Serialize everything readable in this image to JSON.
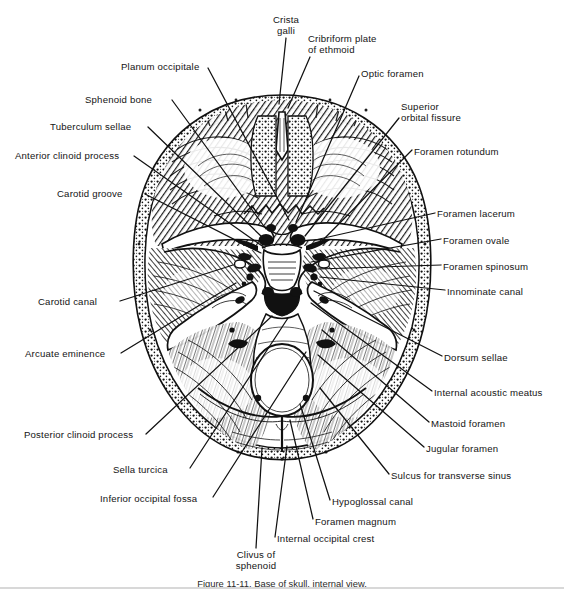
{
  "figure": {
    "caption": "Figure 11-11. Base of skull, internal view.",
    "background_color": "#ffffff",
    "ink_color": "#111111",
    "leader_color": "#111111"
  },
  "labels": [
    {
      "id": "crista-galli",
      "text": "Crista\ngalli",
      "side": "center",
      "x": 286,
      "y": 14,
      "anchor_x": 286,
      "anchor_y": 38,
      "tip_x": 279,
      "tip_y": 104
    },
    {
      "id": "cribriform-plate",
      "text": "Cribriform plate\nof ethmoid",
      "side": "right",
      "x": 308,
      "y": 33,
      "anchor_x": 310,
      "anchor_y": 57,
      "tip_x": 288,
      "tip_y": 108
    },
    {
      "id": "planum-occipitale",
      "text": "Planum occipitale",
      "side": "left",
      "x": 121,
      "y": 61,
      "anchor_x": 208,
      "anchor_y": 68,
      "tip_x": 289,
      "tip_y": 220
    },
    {
      "id": "optic-foramen",
      "text": "Optic foramen",
      "side": "right",
      "x": 361,
      "y": 68,
      "anchor_x": 359,
      "anchor_y": 76,
      "tip_x": 296,
      "tip_y": 222
    },
    {
      "id": "sphenoid-bone",
      "text": "Sphenoid bone",
      "side": "left",
      "x": 85,
      "y": 94,
      "anchor_x": 172,
      "anchor_y": 100,
      "tip_x": 266,
      "tip_y": 229
    },
    {
      "id": "superior-orbital-fissure",
      "text": "Superior\norbital fissure",
      "side": "right",
      "x": 401,
      "y": 101,
      "anchor_x": 399,
      "anchor_y": 118,
      "tip_x": 305,
      "tip_y": 236
    },
    {
      "id": "tuberculum-sellae",
      "text": "Tuberculum sellae",
      "side": "left",
      "x": 50,
      "y": 121,
      "anchor_x": 148,
      "anchor_y": 127,
      "tip_x": 262,
      "tip_y": 237
    },
    {
      "id": "foramen-rotundum",
      "text": "Foramen rotundum",
      "side": "right",
      "x": 414,
      "y": 146,
      "anchor_x": 412,
      "anchor_y": 150,
      "tip_x": 318,
      "tip_y": 245
    },
    {
      "id": "anterior-clinoid-process",
      "text": "Anterior clinoid process",
      "side": "left",
      "x": 15,
      "y": 150,
      "anchor_x": 134,
      "anchor_y": 156,
      "tip_x": 265,
      "tip_y": 248
    },
    {
      "id": "carotid-groove",
      "text": "Carotid groove",
      "side": "left",
      "x": 57,
      "y": 188,
      "anchor_x": 145,
      "anchor_y": 194,
      "tip_x": 261,
      "tip_y": 253
    },
    {
      "id": "foramen-lacerum",
      "text": "Foramen lacerum",
      "side": "right",
      "x": 437,
      "y": 208,
      "anchor_x": 435,
      "anchor_y": 213,
      "tip_x": 315,
      "tip_y": 240
    },
    {
      "id": "foramen-ovale",
      "text": "Foramen ovale",
      "side": "right",
      "x": 443,
      "y": 235,
      "anchor_x": 441,
      "anchor_y": 239,
      "tip_x": 311,
      "tip_y": 262
    },
    {
      "id": "foramen-spinosum",
      "text": "Foramen spinosum",
      "side": "right",
      "x": 443,
      "y": 261,
      "anchor_x": 441,
      "anchor_y": 265,
      "tip_x": 318,
      "tip_y": 269
    },
    {
      "id": "innominate-canal",
      "text": "Innominate canal",
      "side": "right",
      "x": 447,
      "y": 286,
      "anchor_x": 445,
      "anchor_y": 290,
      "tip_x": 320,
      "tip_y": 277
    },
    {
      "id": "carotid-canal",
      "text": "Carotid canal",
      "side": "left",
      "x": 38,
      "y": 296,
      "anchor_x": 120,
      "anchor_y": 301,
      "tip_x": 233,
      "tip_y": 265
    },
    {
      "id": "arcuate-eminence",
      "text": "Arcuate eminence",
      "side": "left",
      "x": 25,
      "y": 348,
      "anchor_x": 121,
      "anchor_y": 353,
      "tip_x": 236,
      "tip_y": 283
    },
    {
      "id": "dorsum-sellae",
      "text": "Dorsum sellae",
      "side": "right",
      "x": 444,
      "y": 352,
      "anchor_x": 442,
      "anchor_y": 356,
      "tip_x": 314,
      "tip_y": 291
    },
    {
      "id": "internal-acoustic-meatus",
      "text": "Internal acoustic meatus",
      "side": "right",
      "x": 434,
      "y": 387,
      "anchor_x": 432,
      "anchor_y": 391,
      "tip_x": 311,
      "tip_y": 303
    },
    {
      "id": "mastoid-foramen",
      "text": "Mastoid foramen",
      "side": "right",
      "x": 431,
      "y": 418,
      "anchor_x": 429,
      "anchor_y": 422,
      "tip_x": 322,
      "tip_y": 330
    },
    {
      "id": "posterior-clinoid-process",
      "text": "Posterior clinoid process",
      "side": "left",
      "x": 24,
      "y": 429,
      "anchor_x": 146,
      "anchor_y": 434,
      "tip_x": 272,
      "tip_y": 316
    },
    {
      "id": "jugular-foramen",
      "text": "Jugular foramen",
      "side": "right",
      "x": 426,
      "y": 443,
      "anchor_x": 424,
      "anchor_y": 447,
      "tip_x": 318,
      "tip_y": 355
    },
    {
      "id": "sella-turcica",
      "text": "Sella turcica",
      "side": "left",
      "x": 113,
      "y": 464,
      "anchor_x": 190,
      "anchor_y": 468,
      "tip_x": 288,
      "tip_y": 318
    },
    {
      "id": "sulcus-transverse-sinus",
      "text": "Sulcus for transverse sinus",
      "side": "right",
      "x": 391,
      "y": 470,
      "anchor_x": 389,
      "anchor_y": 474,
      "tip_x": 320,
      "tip_y": 388
    },
    {
      "id": "inferior-occipital-fossa",
      "text": "Inferior occipital fossa",
      "side": "left",
      "x": 100,
      "y": 493,
      "anchor_x": 213,
      "anchor_y": 497,
      "tip_x": 306,
      "tip_y": 352
    },
    {
      "id": "hypoglossal-canal",
      "text": "Hypoglossal canal",
      "side": "right",
      "x": 332,
      "y": 496,
      "anchor_x": 330,
      "anchor_y": 500,
      "tip_x": 300,
      "tip_y": 404
    },
    {
      "id": "foramen-magnum",
      "text": "Foramen magnum",
      "side": "right",
      "x": 315,
      "y": 516,
      "anchor_x": 313,
      "anchor_y": 519,
      "tip_x": 290,
      "tip_y": 420
    },
    {
      "id": "internal-occipital-crest",
      "text": "Internal occipital crest",
      "side": "right",
      "x": 277,
      "y": 533,
      "anchor_x": 275,
      "anchor_y": 537,
      "tip_x": 287,
      "tip_y": 446
    },
    {
      "id": "clivus-of-sphenoid",
      "text": "Clivus of\nsphenoid",
      "side": "center",
      "x": 256,
      "y": 549,
      "anchor_x": 256,
      "anchor_y": 548,
      "tip_x": 262,
      "tip_y": 448
    }
  ]
}
